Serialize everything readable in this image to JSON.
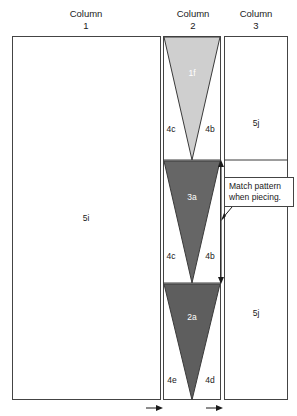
{
  "diagram": {
    "title_columns": [
      {
        "name": "Column",
        "number": "1"
      },
      {
        "name": "Column",
        "number": "2"
      },
      {
        "name": "Column",
        "number": "3"
      }
    ],
    "columns": {
      "column1": {
        "piece_label": "5i"
      },
      "column2": {
        "blocks": [
          {
            "triangle_label": "1f",
            "triangle_fill": "#cfcfcf",
            "left_label": "4c",
            "right_label": "4b"
          },
          {
            "triangle_label": "3a",
            "triangle_fill": "#666666",
            "left_label": "4c",
            "right_label": "4b"
          },
          {
            "triangle_label": "2a",
            "triangle_fill": "#5e5e5e",
            "left_label": "4e",
            "right_label": "4d"
          }
        ]
      },
      "column3": {
        "piece_label_top": "5j",
        "piece_label_bottom": "5j"
      }
    },
    "annotation": {
      "line1": "Match pattern",
      "line2": "when piecing."
    },
    "colors": {
      "outline": "#444444",
      "background": "#ffffff",
      "triangle_light": "#cfcfcf",
      "triangle_dark": "#666666",
      "triangle_mid": "#5e5e5e",
      "text": "#1a1a1a"
    }
  }
}
